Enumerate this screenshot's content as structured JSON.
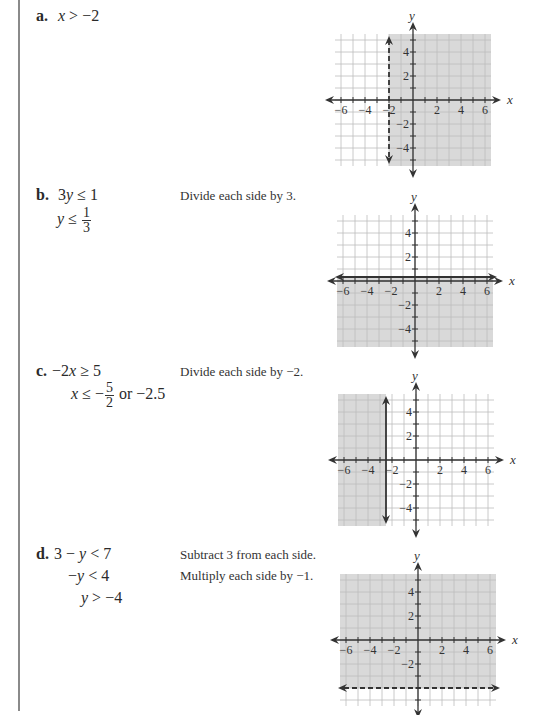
{
  "problems": [
    {
      "label": "a.",
      "lines": [
        {
          "parts": [
            [
              "i",
              "x"
            ],
            [
              "t",
              " > −2"
            ]
          ]
        }
      ],
      "notes": [],
      "graph": {
        "boundary": {
          "type": "vertical",
          "value": -2,
          "style": "dashed"
        },
        "shade": "right",
        "description": "x > -2"
      }
    },
    {
      "label": "b.",
      "lines": [
        {
          "parts": [
            [
              "t",
              "3"
            ],
            [
              "i",
              "y"
            ],
            [
              "t",
              " ≤ 1"
            ]
          ]
        },
        {
          "parts": [
            [
              "i",
              "y"
            ],
            [
              "t",
              " ≤ "
            ],
            [
              "frac",
              "1",
              "3"
            ]
          ]
        }
      ],
      "notes": [
        "Divide each side by 3."
      ],
      "graph": {
        "boundary": {
          "type": "horizontal",
          "value": 0.3333,
          "style": "solid"
        },
        "shade": "below",
        "description": "y ≤ 1/3"
      }
    },
    {
      "label": "c.",
      "lines": [
        {
          "parts": [
            [
              "t",
              "−2"
            ],
            [
              "i",
              "x"
            ],
            [
              "t",
              " ≥ 5"
            ]
          ]
        },
        {
          "parts": [
            [
              "i",
              "x"
            ],
            [
              "t",
              " ≤ −"
            ],
            [
              "frac",
              "5",
              "2"
            ],
            [
              "t",
              " or −2.5"
            ]
          ]
        }
      ],
      "notes": [
        "Divide each side by −2."
      ],
      "graph": {
        "boundary": {
          "type": "vertical",
          "value": -2.5,
          "style": "solid"
        },
        "shade": "left",
        "description": "x ≤ -2.5"
      }
    },
    {
      "label": "d.",
      "lines": [
        {
          "parts": [
            [
              "t",
              "3 − "
            ],
            [
              "i",
              "y"
            ],
            [
              "t",
              " < 7"
            ]
          ]
        },
        {
          "parts": [
            [
              "t",
              "−"
            ],
            [
              "i",
              "y"
            ],
            [
              "t",
              " < 4"
            ]
          ]
        },
        {
          "parts": [
            [
              "i",
              "y"
            ],
            [
              "t",
              " > −4"
            ]
          ]
        }
      ],
      "notes": [
        "Subtract 3 from each side.",
        "Multiply each side by −1."
      ],
      "graph": {
        "boundary": {
          "type": "horizontal",
          "value": -4,
          "style": "dashed"
        },
        "shade": "above",
        "description": "y > -4"
      }
    }
  ],
  "axes": {
    "x_label": "x",
    "y_label": "y",
    "x_ticks": [
      "−6",
      "−4",
      "−2",
      "2",
      "4",
      "6"
    ],
    "x_tick_values": [
      -6,
      -4,
      -2,
      2,
      4,
      6
    ],
    "y_ticks": [
      "4",
      "2",
      "−2",
      "−4"
    ],
    "y_tick_values": [
      4,
      2,
      -2,
      -4
    ],
    "range": [
      -6.5,
      6.5
    ],
    "y_range": [
      -5.5,
      5.5
    ]
  },
  "colors": {
    "shade": "#d9d9d9",
    "grid": "#bdbdbd",
    "axis": "#333333",
    "boundary": "#333333"
  },
  "chart_data": [
    {
      "type": "region",
      "title": "x > -2",
      "xlabel": "x",
      "ylabel": "y",
      "xlim": [
        -6.5,
        6.5
      ],
      "ylim": [
        -5.5,
        5.5
      ],
      "boundary": "x = -2 (dashed)",
      "shaded": "x > -2"
    },
    {
      "type": "region",
      "title": "y ≤ 1/3",
      "xlabel": "x",
      "ylabel": "y",
      "xlim": [
        -6.5,
        6.5
      ],
      "ylim": [
        -5.5,
        5.5
      ],
      "boundary": "y = 1/3 (solid)",
      "shaded": "y ≤ 1/3"
    },
    {
      "type": "region",
      "title": "x ≤ -2.5",
      "xlabel": "x",
      "ylabel": "y",
      "xlim": [
        -6.5,
        6.5
      ],
      "ylim": [
        -5.5,
        5.5
      ],
      "boundary": "x = -2.5 (solid)",
      "shaded": "x ≤ -2.5"
    },
    {
      "type": "region",
      "title": "y > -4",
      "xlabel": "x",
      "ylabel": "y",
      "xlim": [
        -6.5,
        6.5
      ],
      "ylim": [
        -5.5,
        5.5
      ],
      "boundary": "y = -4 (dashed)",
      "shaded": "y > -4"
    }
  ]
}
